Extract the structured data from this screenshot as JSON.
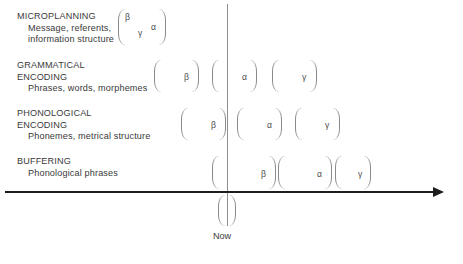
{
  "diagram": {
    "axis": {
      "horizontal_name": "time-axis",
      "vertical_name": "now-line",
      "now_label": "Now"
    },
    "colors": {
      "axis": "#1d1d1d",
      "now_line": "#8f8f8f",
      "bracket": "#8a8a8a",
      "text": "#3a3a3a",
      "glyph": "#4a4a4a",
      "background": "#ffffff"
    },
    "stages": [
      {
        "id": "microplanning",
        "caption": "MICROPLANNING",
        "detail_line_1": "Message, referents,",
        "detail_line_2": "information structure",
        "brackets": [
          {
            "id": "microplanning-bracket-1",
            "glyphs": [
              "β",
              "γ",
              "α"
            ]
          }
        ]
      },
      {
        "id": "grammatical-encoding",
        "caption_line_1": "GRAMMATICAL",
        "caption_line_2": "ENCODING",
        "detail_line_1": "Phrases, words, morphemes",
        "brackets": [
          {
            "id": "grammatical-bracket-beta",
            "glyph": "β"
          },
          {
            "id": "grammatical-bracket-alpha",
            "glyph": "α"
          },
          {
            "id": "grammatical-bracket-gamma",
            "glyph": "γ"
          }
        ]
      },
      {
        "id": "phonological-encoding",
        "caption_line_1": "PHONOLOGICAL",
        "caption_line_2": "ENCODING",
        "detail_line_1": "Phonemes, metrical structure",
        "brackets": [
          {
            "id": "phonological-bracket-beta",
            "glyph": "β"
          },
          {
            "id": "phonological-bracket-alpha",
            "glyph": "α"
          },
          {
            "id": "phonological-bracket-gamma",
            "glyph": "γ"
          }
        ]
      },
      {
        "id": "buffering",
        "caption": "BUFFERING",
        "detail_line_1": "Phonological phrases",
        "brackets": [
          {
            "id": "buffering-bracket-beta",
            "glyph": "β"
          },
          {
            "id": "buffering-bracket-alpha",
            "glyph": "α"
          },
          {
            "id": "buffering-bracket-gamma",
            "glyph": "γ"
          }
        ]
      },
      {
        "id": "articulation",
        "brackets": [
          {
            "id": "articulation-bracket",
            "glyph": ""
          }
        ]
      }
    ]
  }
}
